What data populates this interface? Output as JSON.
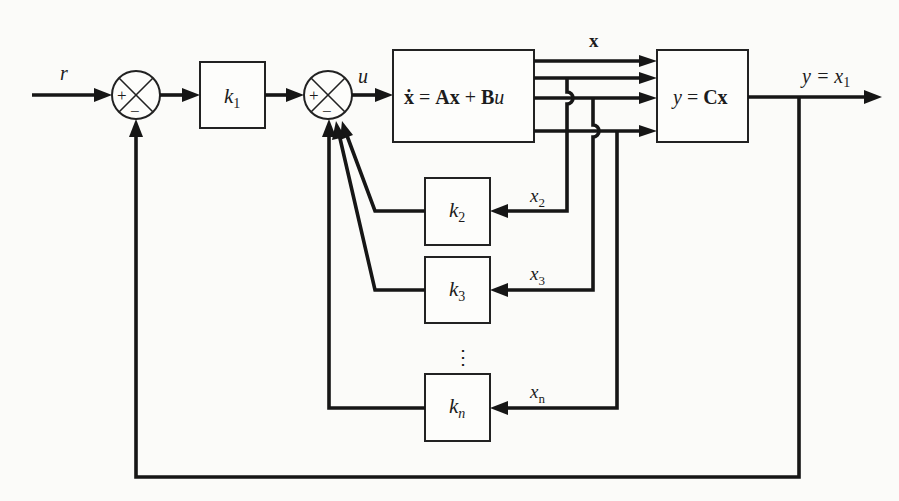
{
  "diagram": {
    "type": "state-feedback block diagram",
    "signals": {
      "reference": "r",
      "control": "u",
      "state_vector": "x",
      "output": "y = x",
      "output_sub": "1",
      "x2": "x",
      "x2_sub": "2",
      "x3": "x",
      "x3_sub": "3",
      "xn": "x",
      "xn_sub": "n"
    },
    "summers": [
      {
        "id": "sum1",
        "plus": "+",
        "minus": "−"
      },
      {
        "id": "sum2",
        "plus": "+",
        "minus": "−"
      }
    ],
    "blocks": {
      "k1": {
        "symbol": "k",
        "sub": "1"
      },
      "plant": {
        "lhs": "ẋ",
        "eq": " = ",
        "a": "Ax",
        "plus": " + ",
        "b": "B",
        "u": "u"
      },
      "output": {
        "y": "y",
        "eq": " = ",
        "c": "Cx"
      },
      "k2": {
        "symbol": "k",
        "sub": "2"
      },
      "k3": {
        "symbol": "k",
        "sub": "3"
      },
      "kn": {
        "symbol": "k",
        "sub": "n"
      },
      "ellipsis": "⋮"
    },
    "colors": {
      "line": "#161616",
      "background": "#fbfbf9"
    }
  }
}
